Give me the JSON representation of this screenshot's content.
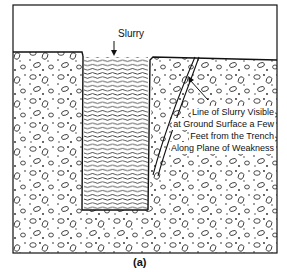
{
  "figure": {
    "title_label": "Slurry",
    "annotation_lines": [
      "Line of Slurry Visible",
      "at Ground Surface a Few",
      "Feet from the Trench",
      "Along Plane of Weakness"
    ],
    "caption": "(a)"
  },
  "diagram": {
    "elements": [
      {
        "id": "soil-left",
        "type": "granular soil"
      },
      {
        "id": "trench",
        "type": "slurry-filled trench"
      },
      {
        "id": "soil-right",
        "type": "granular soil"
      },
      {
        "id": "plane-of-weakness",
        "type": "slurry seepage crack"
      }
    ],
    "colors": {
      "ink": "#111111",
      "background": "#ffffff"
    }
  }
}
